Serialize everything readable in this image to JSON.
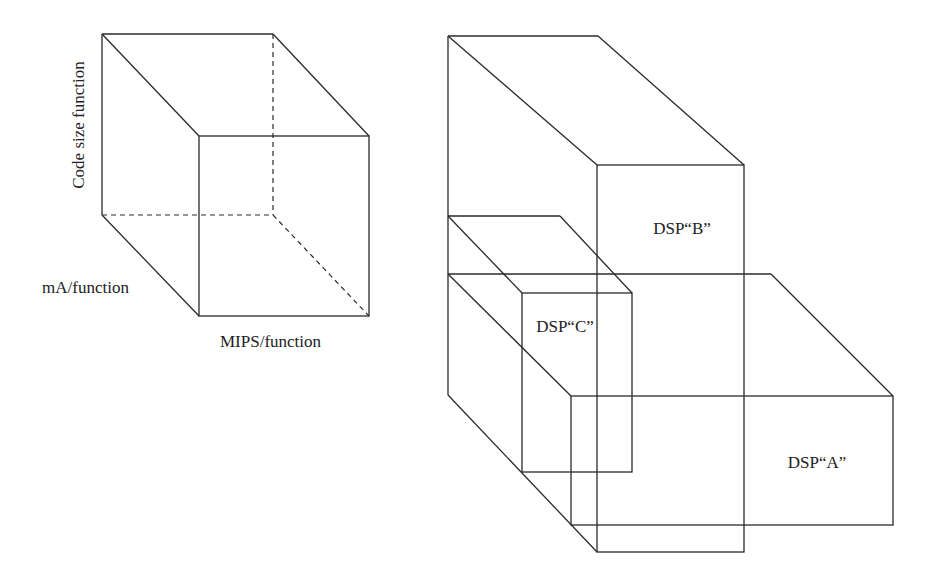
{
  "diagram": {
    "type": "3d-box-comparison",
    "colors": {
      "line": "#2a2a2a",
      "text": "#222222",
      "background": "#ffffff"
    },
    "reference_cube": {
      "axes": {
        "vertical": "Code size function",
        "depth": "mA/function",
        "horizontal": "MIPS/function"
      }
    },
    "boxes": [
      {
        "id": "B",
        "label": "DSP“B”"
      },
      {
        "id": "C",
        "label": "DSP“C”"
      },
      {
        "id": "A",
        "label": "DSP“A”"
      }
    ]
  }
}
